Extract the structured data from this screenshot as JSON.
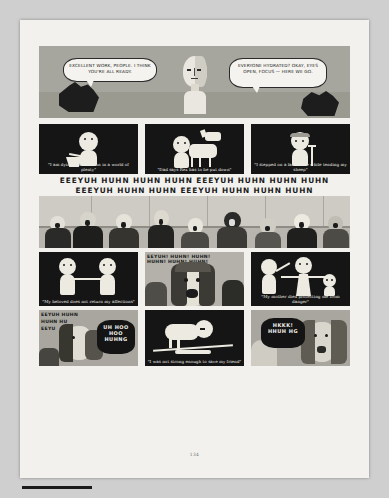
{
  "document": {
    "type": "comic-book-page",
    "page_number": "134",
    "background_color": "#c9c9c9",
    "paper_color": "#f2f1ed"
  },
  "panels": {
    "top": {
      "name": "stage-director-panel",
      "bubbles": [
        {
          "id": "left",
          "text": "EXCELLENT WORK, PEOPLE. I THINK YOU'RE ALL READY."
        },
        {
          "id": "right",
          "text": "EVERYONE HYDRATED? OKAY, EYES OPEN, FOCUS — HERE WE GO."
        }
      ]
    },
    "row2": [
      {
        "name": "panel-starvation",
        "caption": "\"I am dying of starvation in a world of plenty\""
      },
      {
        "name": "panel-dog",
        "caption": "\"Dad says Rex has to be put down\""
      },
      {
        "name": "panel-landmine",
        "caption": "\"I stepped on a land mine while tending my sheep\""
      }
    ],
    "chant": {
      "name": "crowd-chant-text",
      "line1": "EEEYUH HUHN HUHN HUHN EEEYUH HUHN HUHN HUHN",
      "line2": "EEEYUH HUHN HUHN EEEYUH HUHN HUHN HUHN"
    },
    "crowd": {
      "name": "weeping-crowd-panel"
    },
    "row4": [
      {
        "name": "panel-beloved",
        "caption": "\"My beloved does not return my affections\""
      },
      {
        "name": "panel-wailing-woman",
        "shout_line1": "EEYUH! HUHN! HUHN!",
        "shout_line2": "HUHN! HUHN! HUHN!"
      },
      {
        "name": "panel-mother-died",
        "caption": "\"My mother died protecting me from danger\""
      }
    ],
    "row5": [
      {
        "name": "panel-mourners-left",
        "shout_line1": "EEYUH HUHN",
        "shout_line2": "HUHN HU",
        "shout_line3": "EEYU",
        "bubble": "UH HOO HOO HUHNG"
      },
      {
        "name": "panel-fallen-friend",
        "caption": "\"I was not strong enough to save my friend\""
      },
      {
        "name": "panel-mourners-right",
        "bubble": "HKKK! HHUH HG"
      }
    ]
  }
}
